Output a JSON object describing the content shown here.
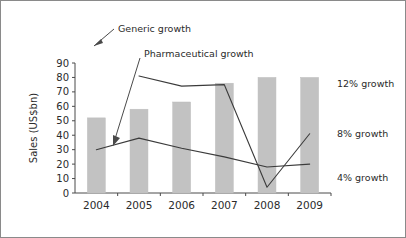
{
  "chart_data": {
    "type": "bar",
    "title": "",
    "xlabel": "",
    "ylabel": "Sales (US$bn)",
    "categories": [
      "2004",
      "2005",
      "2006",
      "2007",
      "2008",
      "2009"
    ],
    "ylim": [
      0,
      90
    ],
    "yticks": [
      0,
      10,
      20,
      30,
      40,
      50,
      60,
      70,
      80,
      90
    ],
    "ytick_labels": [
      "0",
      "10",
      "20",
      "30",
      "40",
      "50",
      "60",
      "70",
      "80",
      "90"
    ],
    "grid": false,
    "legend_position": "none",
    "bar_series": {
      "name": "Sales",
      "color": "#c2c2c2",
      "values": [
        52,
        58,
        63,
        76,
        80,
        80
      ]
    },
    "series": [
      {
        "name": "Generic growth",
        "type": "line",
        "color": "#3b3b3b",
        "x": [
          "2005",
          "2006",
          "2007",
          "2008",
          "2009"
        ],
        "values": [
          81,
          74,
          75,
          4,
          41
        ]
      },
      {
        "name": "Pharmaceutical growth",
        "type": "line",
        "color": "#3b3b3b",
        "x": [
          "2004",
          "2005",
          "2006",
          "2007",
          "2008",
          "2009"
        ],
        "values": [
          30,
          38,
          31,
          25,
          18,
          20
        ]
      }
    ],
    "annotations": [
      {
        "id": "generic",
        "text": "Generic growth"
      },
      {
        "id": "pharmaceutical",
        "text": "Pharmaceutical growth"
      }
    ],
    "right_labels": [
      {
        "id": "growth-12",
        "text": "12% growth",
        "value": 76
      },
      {
        "id": "growth-8",
        "text": "8% growth",
        "value": 41
      },
      {
        "id": "growth-4",
        "text": "4% growth",
        "value": 11
      }
    ]
  }
}
